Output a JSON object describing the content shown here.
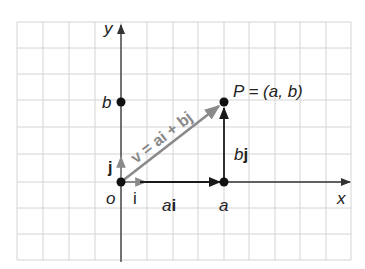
{
  "diagram": {
    "grid": {
      "left": 17,
      "top": 22,
      "right": 351,
      "bottom": 260,
      "x_lines": [
        17,
        43,
        69,
        95,
        121,
        147,
        173,
        198,
        224,
        249,
        275,
        300,
        326,
        351
      ],
      "y_lines": [
        22,
        48,
        74,
        100,
        127,
        154,
        182,
        208,
        234,
        260
      ],
      "color": "#d4d4d4"
    },
    "axes": {
      "origin": {
        "x": 121,
        "y": 182
      },
      "x_label": "x",
      "y_label": "y",
      "origin_label": "o",
      "color": "#333333"
    },
    "points": {
      "origin": {
        "x": 121,
        "y": 182
      },
      "a": {
        "x": 224,
        "y": 182,
        "label": "a"
      },
      "b": {
        "x": 121,
        "y": 102,
        "label": "b"
      },
      "P": {
        "x": 224,
        "y": 102,
        "label": "P = (a, b)"
      }
    },
    "vectors": {
      "v": {
        "label": "v = ai + bj",
        "color": "#8a8a8a"
      },
      "ai": {
        "label_coef": "a",
        "label_unit": "i",
        "color": "#1a1a1a"
      },
      "bj": {
        "label_coef": "b",
        "label_unit": "j",
        "color": "#1a1a1a"
      },
      "i": {
        "label": "i",
        "color": "#8a8a8a"
      },
      "j": {
        "label": "j",
        "color": "#8a8a8a"
      }
    }
  }
}
